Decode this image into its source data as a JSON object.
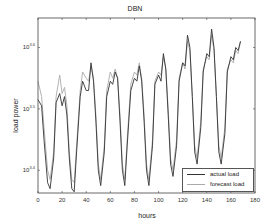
{
  "chart_data": {
    "type": "line",
    "title": "DBN",
    "xlabel": "hours",
    "ylabel": "load power",
    "xlim": [
      0,
      180
    ],
    "yscale": "log",
    "xticks": [
      0,
      20,
      40,
      60,
      80,
      100,
      120,
      140,
      160,
      180
    ],
    "yticks": [
      {
        "label": "10^3.4",
        "exp": 3.4
      },
      {
        "label": "10^3.5",
        "exp": 3.5
      },
      {
        "label": "10^3.6",
        "exp": 3.6
      }
    ],
    "ylim_exp": [
      3.363,
      3.648
    ],
    "grid": false,
    "legend_position": "lower right",
    "x": [
      0,
      3,
      5,
      8,
      10,
      13,
      15,
      18,
      20,
      22,
      24,
      26,
      28,
      30,
      32,
      35,
      37,
      40,
      42,
      44,
      46,
      48,
      50,
      52,
      55,
      57,
      60,
      62,
      64,
      66,
      68,
      70,
      72,
      74,
      77,
      80,
      82,
      84,
      86,
      88,
      90,
      92,
      95,
      97,
      100,
      102,
      104,
      106,
      108,
      110,
      112,
      115,
      117,
      120,
      122,
      124,
      126,
      128,
      130,
      132,
      135,
      137,
      140,
      142,
      144,
      146,
      148,
      150,
      152,
      155,
      157,
      160,
      162,
      164,
      166,
      168
    ],
    "series": [
      {
        "name": "actual load",
        "color": "#333333",
        "values": [
          3.515,
          3.505,
          3.45,
          3.38,
          3.37,
          3.42,
          3.51,
          3.525,
          3.505,
          3.52,
          3.49,
          3.42,
          3.37,
          3.365,
          3.43,
          3.52,
          3.545,
          3.53,
          3.53,
          3.575,
          3.545,
          3.48,
          3.4,
          3.375,
          3.43,
          3.52,
          3.545,
          3.54,
          3.56,
          3.55,
          3.48,
          3.4,
          3.375,
          3.44,
          3.53,
          3.55,
          3.545,
          3.57,
          3.545,
          3.48,
          3.4,
          3.375,
          3.44,
          3.54,
          3.555,
          3.545,
          3.59,
          3.565,
          3.49,
          3.41,
          3.39,
          3.44,
          3.545,
          3.575,
          3.57,
          3.62,
          3.6,
          3.52,
          3.43,
          3.41,
          3.47,
          3.56,
          3.59,
          3.585,
          3.63,
          3.6,
          3.52,
          3.43,
          3.41,
          3.46,
          3.56,
          3.585,
          3.58,
          3.6,
          3.595,
          3.61
        ]
      },
      {
        "name": "forecast load",
        "color": "#aaaaaa",
        "values": [
          3.545,
          3.52,
          3.47,
          3.4,
          3.385,
          3.43,
          3.52,
          3.555,
          3.525,
          3.535,
          3.505,
          3.43,
          3.385,
          3.38,
          3.44,
          3.53,
          3.56,
          3.55,
          3.545,
          3.57,
          3.55,
          3.49,
          3.41,
          3.385,
          3.44,
          3.53,
          3.56,
          3.55,
          3.565,
          3.55,
          3.49,
          3.41,
          3.385,
          3.45,
          3.54,
          3.56,
          3.555,
          3.575,
          3.55,
          3.49,
          3.41,
          3.385,
          3.45,
          3.545,
          3.56,
          3.555,
          3.585,
          3.565,
          3.5,
          3.42,
          3.4,
          3.45,
          3.55,
          3.575,
          3.565,
          3.61,
          3.595,
          3.52,
          3.44,
          3.42,
          3.48,
          3.565,
          3.585,
          3.58,
          3.62,
          3.595,
          3.52,
          3.44,
          3.42,
          3.47,
          3.565,
          3.58,
          3.575,
          3.595,
          3.59,
          3.61
        ]
      }
    ]
  }
}
